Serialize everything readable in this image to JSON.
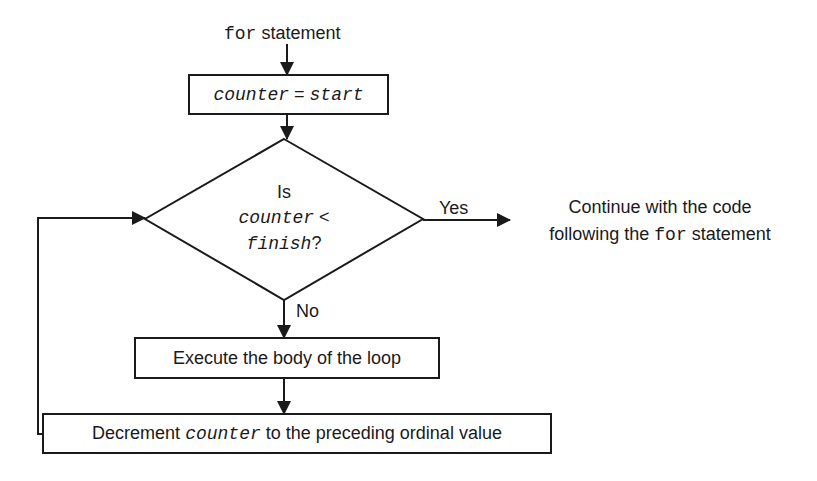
{
  "diagram": {
    "type": "flowchart",
    "entry": {
      "keyword": "for",
      "text": " statement"
    },
    "init_box": {
      "lhs": "counter",
      "op": " = ",
      "rhs": "start"
    },
    "decision": {
      "line1": "Is",
      "var1": "counter",
      "op": " <",
      "var2": "finish",
      "q": "?"
    },
    "yes_label": "Yes",
    "no_label": "No",
    "exit_text": {
      "line1": "Continue with the code",
      "line2_pre": "following the ",
      "line2_kw": "for",
      "line2_post": " statement"
    },
    "body_box": "Execute the body of the loop",
    "update_box": {
      "pre": "Decrement ",
      "var": "counter",
      "post": " to the preceding ordinal value"
    },
    "colors": {
      "stroke": "#1a1a1a",
      "background": "#ffffff"
    }
  }
}
